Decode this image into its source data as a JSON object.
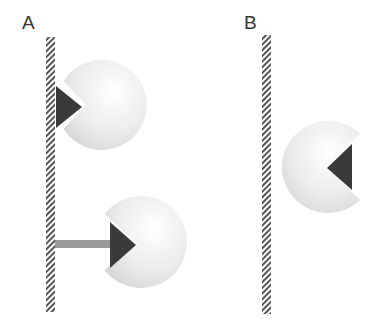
{
  "panels": [
    {
      "label": "A"
    },
    {
      "label": "B"
    }
  ],
  "colors": {
    "background": "#ffffff",
    "wall_hatch": "#555555",
    "sphere_light": "#ffffff",
    "sphere_dark": "#d6d6d6",
    "triangle": "#3a3a3a",
    "bar": "#9a9a9a",
    "label": "#333333"
  },
  "elements": {
    "panel_a": {
      "wall": {
        "x": 46,
        "y": 37,
        "width": 9,
        "height": 275
      },
      "top_sphere": {
        "cx": 102,
        "cy": 105,
        "r": 45,
        "mouth": "left"
      },
      "bottom_sphere": {
        "cx": 145,
        "cy": 242,
        "r": 46,
        "mouth": "left",
        "connected_by_bar": true
      },
      "bar": {
        "x": 55,
        "y": 240,
        "width": 56,
        "height": 8
      }
    },
    "panel_b": {
      "wall": {
        "x": 262,
        "y": 35,
        "width": 9,
        "height": 279
      },
      "sphere": {
        "cx": 318,
        "cy": 166,
        "r": 46,
        "mouth": "right"
      }
    }
  }
}
